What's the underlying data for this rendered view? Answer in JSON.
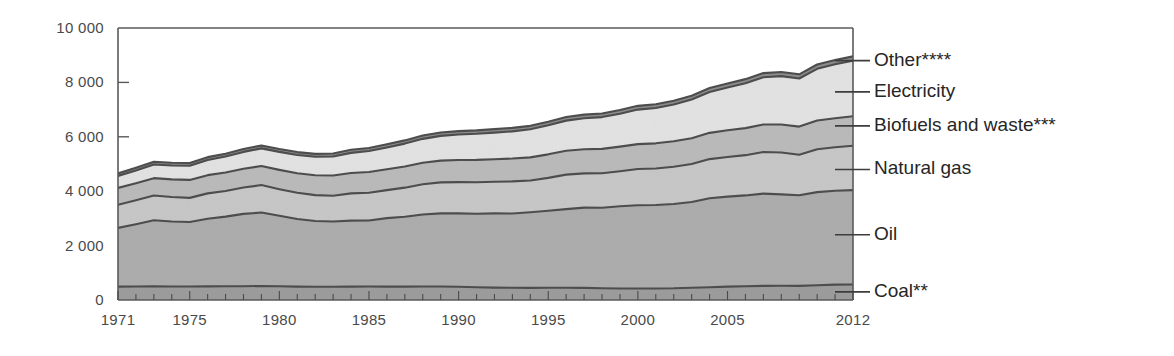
{
  "chart_data": {
    "type": "area",
    "stacked": true,
    "title": "",
    "subtitle": "",
    "xlabel": "",
    "ylabel": "",
    "xlim": [
      1971,
      2012
    ],
    "ylim": [
      0,
      10000
    ],
    "y_ticks": [
      "0",
      "2 000",
      "4 000",
      "6 000",
      "8 000",
      "10 000"
    ],
    "y_tick_values": [
      0,
      2000,
      4000,
      6000,
      8000,
      10000
    ],
    "x_ticks": [
      "1971",
      "1975",
      "1980",
      "1985",
      "1990",
      "1995",
      "2000",
      "2005",
      "2012"
    ],
    "x_tick_values": [
      1971,
      1975,
      1980,
      1985,
      1990,
      1995,
      2000,
      2005,
      2012
    ],
    "grid": false,
    "legend_position": "right-inline",
    "x": [
      1971,
      1972,
      1973,
      1974,
      1975,
      1976,
      1977,
      1978,
      1979,
      1980,
      1981,
      1982,
      1983,
      1984,
      1985,
      1986,
      1987,
      1988,
      1989,
      1990,
      1991,
      1992,
      1993,
      1994,
      1995,
      1996,
      1997,
      1998,
      1999,
      2000,
      2001,
      2002,
      2003,
      2004,
      2005,
      2006,
      2007,
      2008,
      2009,
      2010,
      2011,
      2012
    ],
    "series": [
      {
        "name": "Coal**",
        "color": "#9a9a9a",
        "values": [
          490,
          495,
          500,
          495,
          495,
          500,
          505,
          505,
          515,
          505,
          490,
          485,
          485,
          490,
          495,
          490,
          490,
          495,
          495,
          485,
          470,
          455,
          450,
          445,
          450,
          450,
          445,
          430,
          425,
          425,
          425,
          430,
          450,
          470,
          490,
          505,
          520,
          525,
          520,
          545,
          565,
          570
        ]
      },
      {
        "name": "Oil",
        "color": "#ababab",
        "values": [
          2160,
          2290,
          2430,
          2390,
          2370,
          2490,
          2560,
          2660,
          2700,
          2590,
          2490,
          2420,
          2400,
          2430,
          2430,
          2520,
          2570,
          2650,
          2690,
          2700,
          2700,
          2730,
          2730,
          2780,
          2830,
          2890,
          2950,
          2960,
          3020,
          3060,
          3070,
          3100,
          3150,
          3270,
          3310,
          3340,
          3390,
          3360,
          3330,
          3420,
          3450,
          3470
        ]
      },
      {
        "name": "Natural gas",
        "color": "#c6c6c6",
        "values": [
          850,
          880,
          910,
          900,
          890,
          930,
          940,
          970,
          1010,
          980,
          960,
          950,
          950,
          1000,
          1020,
          1030,
          1070,
          1110,
          1140,
          1150,
          1160,
          1160,
          1180,
          1170,
          1210,
          1270,
          1260,
          1270,
          1290,
          1330,
          1340,
          1370,
          1400,
          1440,
          1460,
          1480,
          1530,
          1540,
          1490,
          1580,
          1600,
          1630
        ]
      },
      {
        "name": "Biofuels and waste***",
        "color": "#b9b9b9",
        "values": [
          620,
          630,
          640,
          650,
          660,
          670,
          680,
          690,
          700,
          710,
          720,
          730,
          740,
          750,
          760,
          770,
          780,
          790,
          800,
          810,
          820,
          830,
          840,
          850,
          865,
          875,
          885,
          895,
          905,
          915,
          925,
          935,
          950,
          965,
          980,
          995,
          1010,
          1025,
          1035,
          1055,
          1070,
          1085
        ]
      },
      {
        "name": "Electricity",
        "color": "#e2e2e2",
        "values": [
          440,
          470,
          500,
          510,
          520,
          560,
          590,
          620,
          650,
          660,
          670,
          680,
          700,
          740,
          770,
          800,
          840,
          880,
          910,
          940,
          960,
          980,
          1000,
          1030,
          1070,
          1110,
          1140,
          1170,
          1210,
          1270,
          1300,
          1350,
          1420,
          1500,
          1570,
          1650,
          1740,
          1780,
          1770,
          1900,
          1980,
          2040
        ]
      },
      {
        "name": "Other****",
        "color": "#8a8a8a",
        "values": [
          95,
          98,
          100,
          100,
          100,
          102,
          104,
          106,
          108,
          108,
          108,
          108,
          110,
          112,
          114,
          116,
          118,
          120,
          122,
          124,
          126,
          126,
          128,
          128,
          130,
          132,
          134,
          134,
          136,
          138,
          138,
          140,
          142,
          146,
          148,
          150,
          152,
          154,
          152,
          158,
          160,
          162
        ]
      }
    ],
    "legend": [
      {
        "label": "Other****",
        "anchor_value": 8800
      },
      {
        "label": "Electricity",
        "anchor_value": 7650
      },
      {
        "label": "Biofuels and waste***",
        "anchor_value": 6400
      },
      {
        "label": "Natural gas",
        "anchor_value": 4800
      },
      {
        "label": "Oil",
        "anchor_value": 2400
      },
      {
        "label": "Coal**",
        "anchor_value": 300
      }
    ]
  }
}
